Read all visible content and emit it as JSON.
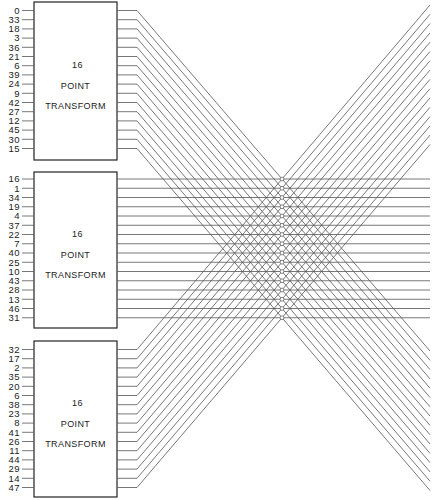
{
  "blocks": [
    {
      "title_line1": "16",
      "title_line2": "POINT",
      "title_line3": "TRANSFORM",
      "inputs": [
        "0",
        "33",
        "18",
        "3",
        "36",
        "21",
        "6",
        "39",
        "24",
        "9",
        "42",
        "27",
        "12",
        "45",
        "30",
        "15"
      ]
    },
    {
      "title_line1": "16",
      "title_line2": "POINT",
      "title_line3": "TRANSFORM",
      "inputs": [
        "16",
        "1",
        "34",
        "19",
        "4",
        "37",
        "22",
        "7",
        "40",
        "25",
        "10",
        "43",
        "28",
        "13",
        "46",
        "31"
      ]
    },
    {
      "title_line1": "16",
      "title_line2": "POINT",
      "title_line3": "TRANSFORM",
      "inputs": [
        "32",
        "17",
        "2",
        "35",
        "20",
        "6",
        "38",
        "23",
        "8",
        "41",
        "26",
        "11",
        "44",
        "29",
        "14",
        "47"
      ]
    }
  ],
  "colors": {
    "line": "#555555",
    "box": "#222222",
    "text": "#222222"
  }
}
